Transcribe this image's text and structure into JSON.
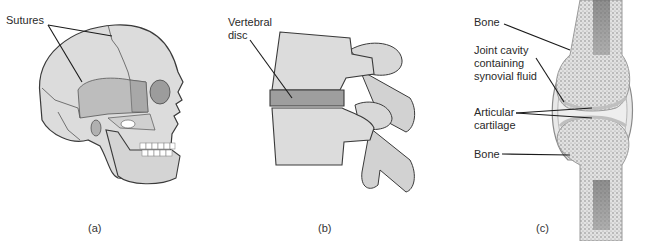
{
  "panels": [
    {
      "id": "a",
      "caption": "(a)",
      "subject": "skull",
      "labels": [
        {
          "text": "Sutures"
        }
      ]
    },
    {
      "id": "b",
      "caption": "(b)",
      "subject": "vertebrae",
      "labels": [
        {
          "text": "Vertebral\ndisc"
        }
      ]
    },
    {
      "id": "c",
      "caption": "(c)",
      "subject": "synovial-joint",
      "labels": [
        {
          "text": "Bone"
        },
        {
          "text": "Joint cavity\ncontaining\nsynovial fluid"
        },
        {
          "text": "Articular\ncartilage"
        },
        {
          "text": "Bone"
        }
      ]
    }
  ],
  "colors": {
    "bone_fill": "#dcdcdc",
    "bone_shade": "#c4c4c4",
    "bone_dark": "#a9a9a9",
    "outline": "#3a3a3a",
    "leader_line": "#1a1a1a",
    "marrow": "#5a5a5a",
    "background": "#ffffff"
  }
}
